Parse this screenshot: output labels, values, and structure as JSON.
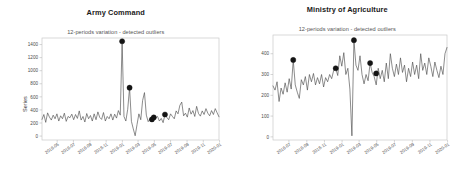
{
  "figure": {
    "background_color": "#ffffff",
    "line_color": "#4d4d4d",
    "outlier_color": "#141414",
    "frame_color": "#c9c9c9"
  },
  "panels": [
    {
      "id": "army-command",
      "title": "Army Command",
      "subtitle": "12-periods variation - detected outliers",
      "ylabel": "Series"
    },
    {
      "id": "ministry-of-agriculture",
      "title": "Ministry of Agriculture",
      "subtitle": "12-periods variation - detected outliers",
      "ylabel": "Series"
    }
  ],
  "chart_data": [
    {
      "type": "line",
      "title": "Army Command",
      "subtitle": "12-periods variation - detected outliers",
      "xlabel": "",
      "ylabel": "Series",
      "grid": false,
      "legend": "none",
      "ylim": [
        -60,
        1500
      ],
      "yticks": [
        0,
        200,
        400,
        600,
        800,
        1000,
        1200,
        1400
      ],
      "xticks": [
        "2018-03",
        "2018-05",
        "2018-07",
        "2018-09",
        "2018-11",
        "2019-01",
        "2019-03",
        "2019-05",
        "2019-07",
        "2019-09",
        "2019-11",
        "2020-01"
      ],
      "xlim": [
        "2018-03",
        "2020-01"
      ],
      "series": [
        {
          "name": "Series",
          "x": [
            "2018-03-05",
            "2018-03-12",
            "2018-03-19",
            "2018-03-26",
            "2018-04-02",
            "2018-04-09",
            "2018-04-16",
            "2018-04-23",
            "2018-04-30",
            "2018-05-07",
            "2018-05-14",
            "2018-05-21",
            "2018-05-28",
            "2018-06-04",
            "2018-06-11",
            "2018-06-18",
            "2018-06-25",
            "2018-07-02",
            "2018-07-09",
            "2018-07-16",
            "2018-07-23",
            "2018-07-30",
            "2018-08-06",
            "2018-08-13",
            "2018-08-20",
            "2018-08-27",
            "2018-09-03",
            "2018-09-10",
            "2018-09-17",
            "2018-09-24",
            "2018-10-01",
            "2018-10-08",
            "2018-10-15",
            "2018-10-22",
            "2018-10-29",
            "2018-11-05",
            "2018-11-12",
            "2018-11-19",
            "2018-11-26",
            "2018-12-03",
            "2018-12-10",
            "2018-12-17",
            "2018-12-24",
            "2018-12-31",
            "2019-01-07",
            "2019-01-14",
            "2019-01-21",
            "2019-01-28",
            "2019-02-04",
            "2019-02-11",
            "2019-02-18",
            "2019-02-25",
            "2019-03-04",
            "2019-03-11",
            "2019-03-18",
            "2019-03-25",
            "2019-04-01",
            "2019-04-08",
            "2019-04-15",
            "2019-04-22",
            "2019-04-29",
            "2019-05-06",
            "2019-05-13",
            "2019-05-20",
            "2019-05-27",
            "2019-06-03",
            "2019-06-10",
            "2019-06-17",
            "2019-06-24",
            "2019-07-01",
            "2019-07-08",
            "2019-07-15",
            "2019-07-22",
            "2019-07-29",
            "2019-08-05",
            "2019-08-12",
            "2019-08-19",
            "2019-08-26",
            "2019-09-02",
            "2019-09-09",
            "2019-09-16",
            "2019-09-23",
            "2019-09-30",
            "2019-10-07",
            "2019-10-14",
            "2019-10-21",
            "2019-10-28",
            "2019-11-04",
            "2019-11-11",
            "2019-11-18",
            "2019-11-25",
            "2019-12-02",
            "2019-12-09",
            "2019-12-16",
            "2019-12-23",
            "2019-12-30"
          ],
          "values": [
            255,
            330,
            210,
            355,
            290,
            245,
            320,
            265,
            340,
            230,
            310,
            265,
            350,
            225,
            300,
            280,
            335,
            250,
            330,
            270,
            385,
            245,
            300,
            215,
            345,
            265,
            315,
            230,
            340,
            250,
            370,
            285,
            255,
            360,
            230,
            300,
            265,
            340,
            245,
            335,
            275,
            390,
            320,
            1450,
            300,
            230,
            410,
            740,
            225,
            110,
            5,
            175,
            340,
            250,
            545,
            665,
            320,
            220,
            265,
            255,
            285,
            275,
            300,
            230,
            270,
            205,
            330,
            285,
            250,
            340,
            300,
            265,
            385,
            340,
            470,
            520,
            310,
            350,
            290,
            430,
            335,
            390,
            300,
            455,
            345,
            305,
            385,
            330,
            420,
            350,
            310,
            390,
            330,
            420,
            355,
            295,
            600
          ]
        }
      ],
      "outliers": [
        {
          "x": "2018-12-31",
          "y": 1450
        },
        {
          "x": "2019-01-28",
          "y": 740
        },
        {
          "x": "2019-04-22",
          "y": 255
        },
        {
          "x": "2019-04-29",
          "y": 285
        },
        {
          "x": "2019-06-10",
          "y": 330
        }
      ]
    },
    {
      "type": "line",
      "title": "Ministry of Agriculture",
      "subtitle": "12-periods variation - detected outliers",
      "xlabel": "",
      "ylabel": "Series",
      "grid": false,
      "legend": "none",
      "ylim": [
        -15,
        490
      ],
      "yticks": [
        0,
        100,
        200,
        300,
        400
      ],
      "xticks": [
        "2018-05",
        "2018-07",
        "2018-09",
        "2018-11",
        "2019-01",
        "2019-03",
        "2019-05",
        "2019-07",
        "2019-09",
        "2019-11",
        "2020-01"
      ],
      "xlim": [
        "2018-05",
        "2020-01"
      ],
      "series": [
        {
          "name": "Series",
          "x": [
            "2018-05-07",
            "2018-05-14",
            "2018-05-21",
            "2018-05-28",
            "2018-06-04",
            "2018-06-11",
            "2018-06-18",
            "2018-06-25",
            "2018-07-02",
            "2018-07-09",
            "2018-07-16",
            "2018-07-23",
            "2018-07-30",
            "2018-08-06",
            "2018-08-13",
            "2018-08-20",
            "2018-08-27",
            "2018-09-03",
            "2018-09-10",
            "2018-09-17",
            "2018-09-24",
            "2018-10-01",
            "2018-10-08",
            "2018-10-15",
            "2018-10-22",
            "2018-10-29",
            "2018-11-05",
            "2018-11-12",
            "2018-11-19",
            "2018-11-26",
            "2018-12-03",
            "2018-12-10",
            "2018-12-17",
            "2018-12-24",
            "2018-12-31",
            "2019-01-07",
            "2019-01-14",
            "2019-01-21",
            "2019-01-28",
            "2019-02-04",
            "2019-02-11",
            "2019-02-18",
            "2019-02-25",
            "2019-03-04",
            "2019-03-11",
            "2019-03-18",
            "2019-03-25",
            "2019-04-01",
            "2019-04-08",
            "2019-04-15",
            "2019-04-22",
            "2019-04-29",
            "2019-05-06",
            "2019-05-13",
            "2019-05-20",
            "2019-05-27",
            "2019-06-03",
            "2019-06-10",
            "2019-06-17",
            "2019-06-24",
            "2019-07-01",
            "2019-07-08",
            "2019-07-15",
            "2019-07-22",
            "2019-07-29",
            "2019-08-05",
            "2019-08-12",
            "2019-08-19",
            "2019-08-26",
            "2019-09-02",
            "2019-09-09",
            "2019-09-16",
            "2019-09-23",
            "2019-09-30",
            "2019-10-07",
            "2019-10-14",
            "2019-10-21",
            "2019-10-28",
            "2019-11-04",
            "2019-11-11",
            "2019-11-18",
            "2019-11-25",
            "2019-12-02",
            "2019-12-09",
            "2019-12-16",
            "2019-12-23",
            "2019-12-30"
          ],
          "values": [
            245,
            225,
            265,
            170,
            235,
            205,
            260,
            215,
            280,
            230,
            370,
            250,
            215,
            185,
            275,
            250,
            290,
            225,
            300,
            265,
            305,
            250,
            285,
            255,
            300,
            240,
            285,
            265,
            300,
            280,
            320,
            330,
            295,
            390,
            340,
            405,
            300,
            330,
            230,
            5,
            465,
            345,
            320,
            390,
            300,
            255,
            300,
            270,
            355,
            310,
            290,
            250,
            330,
            280,
            320,
            265,
            355,
            280,
            400,
            330,
            290,
            350,
            300,
            380,
            310,
            345,
            265,
            330,
            290,
            360,
            300,
            345,
            280,
            400,
            320,
            355,
            300,
            380,
            340,
            290,
            360,
            320,
            285,
            340,
            300,
            400,
            430,
            465
          ]
        }
      ],
      "outliers": [
        {
          "x": "2018-07-16",
          "y": 370
        },
        {
          "x": "2018-12-10",
          "y": 330
        },
        {
          "x": "2019-02-11",
          "y": 465
        },
        {
          "x": "2019-04-08",
          "y": 355
        },
        {
          "x": "2019-04-29",
          "y": 305
        }
      ]
    }
  ]
}
